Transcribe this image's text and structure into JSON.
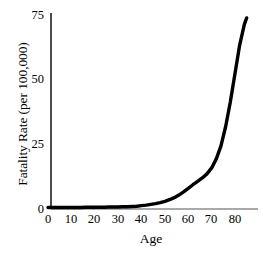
{
  "chart_data": {
    "type": "line",
    "title": "",
    "xlabel": "Age",
    "ylabel": "Fatality Rate (per 100,000)",
    "xlim": [
      0,
      85
    ],
    "ylim": [
      0,
      75
    ],
    "xticks": [
      "0",
      "10",
      "20",
      "30",
      "40",
      "50",
      "60",
      "70",
      "80"
    ],
    "xtick_values": [
      0,
      10,
      20,
      30,
      40,
      50,
      60,
      70,
      80
    ],
    "yticks": [
      "0",
      "25",
      "50",
      "75"
    ],
    "ytick_values": [
      0,
      25,
      50,
      75
    ],
    "grid": false,
    "legend": false,
    "line_color": "#000000",
    "axis_color": "#000000",
    "xaxis_color": "#8c8c8c",
    "background": "#ffffff",
    "series": [
      {
        "name": "Fatality Rate",
        "x": [
          0,
          2,
          4,
          6,
          8,
          10,
          12,
          14,
          16,
          18,
          20,
          22,
          24,
          26,
          28,
          30,
          32,
          34,
          36,
          38,
          40,
          42,
          44,
          46,
          48,
          50,
          52,
          54,
          56,
          58,
          60,
          62,
          64,
          66,
          68,
          70,
          72,
          74,
          76,
          78,
          80,
          82,
          84,
          85
        ],
        "values": [
          0.2,
          0.2,
          0.2,
          0.2,
          0.2,
          0.2,
          0.2,
          0.2,
          0.3,
          0.3,
          0.3,
          0.3,
          0.3,
          0.4,
          0.4,
          0.4,
          0.5,
          0.5,
          0.6,
          0.7,
          0.9,
          1.1,
          1.4,
          1.7,
          2.1,
          2.6,
          3.2,
          4.0,
          5.0,
          6.2,
          7.6,
          9.0,
          10.3,
          11.6,
          13.2,
          15.5,
          19.0,
          24.0,
          31.5,
          41.0,
          52.0,
          63.0,
          71.0,
          73.5
        ]
      }
    ]
  },
  "axis": {
    "ytick_labels": [
      "75",
      "50",
      "25",
      "0"
    ],
    "xtick_labels": [
      "0",
      "10",
      "20",
      "30",
      "40",
      "50",
      "60",
      "70",
      "80"
    ],
    "y_axis_title": "Fatality Rate (per 100,000)",
    "x_axis_title": "Age"
  }
}
